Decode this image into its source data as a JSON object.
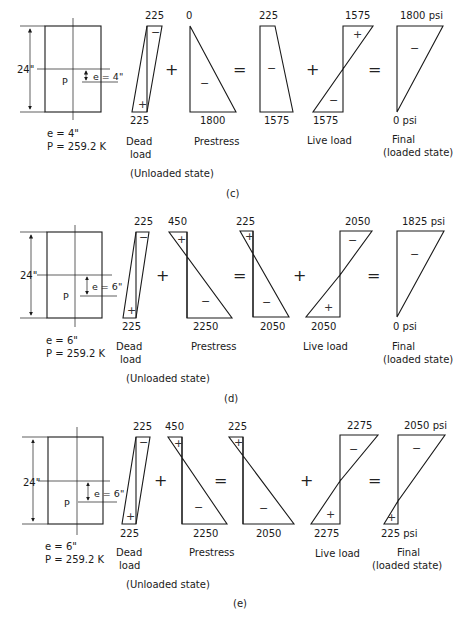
{
  "panels": [
    {
      "id": "c",
      "caption": "(c)",
      "section": {
        "depth": "24\"",
        "e_arrow": "e = 4\"",
        "P_label": "P",
        "e_value": "e = 4\"",
        "P_value": "P = 259.2 K"
      },
      "dead_load": {
        "top": "225",
        "bottom": "225",
        "top_sign": "−",
        "bottom_sign": "+",
        "label1": "Dead",
        "label2": "load"
      },
      "prestress": {
        "top": "0",
        "bottom": "1800",
        "sign": "−",
        "label": "Prestress"
      },
      "sum1": {
        "top": "225",
        "bottom": "1575",
        "sign": "−"
      },
      "live_load": {
        "top": "1575",
        "bottom": "1575",
        "top_sign": "+",
        "bottom_sign": "−",
        "label": "Live load"
      },
      "final": {
        "top": "1800 psi",
        "bottom": "0 psi",
        "sign": "−",
        "label1": "Final",
        "label2": "(loaded state)"
      },
      "unloaded_label": "(Unloaded state)",
      "ops": {
        "plus1": "+",
        "eq1": "=",
        "plus2": "+",
        "eq2": "="
      }
    },
    {
      "id": "d",
      "caption": "(d)",
      "section": {
        "depth": "24\"",
        "e_arrow": "e = 6\"",
        "P_label": "P",
        "e_value": "e = 6\"",
        "P_value": "P = 259.2 K"
      },
      "dead_load": {
        "top": "225",
        "bottom": "225",
        "top_sign": "−",
        "bottom_sign": "+",
        "label1": "Dead",
        "label2": "load"
      },
      "prestress": {
        "top": "450",
        "bottom": "2250",
        "top_sign": "+",
        "sign": "−",
        "label": "Prestress"
      },
      "sum1": {
        "top": "225",
        "bottom": "2050",
        "top_sign": "+",
        "sign": "−"
      },
      "live_load": {
        "top": "2050",
        "bottom": "2050",
        "top_sign": "−",
        "bottom_sign": "+",
        "label": "Live load"
      },
      "final": {
        "top": "1825 psi",
        "bottom": "0 psi",
        "sign": "−",
        "label1": "Final",
        "label2": "(loaded state)"
      },
      "unloaded_label": "(Unloaded state)",
      "ops": {
        "plus1": "+",
        "eq1": "=",
        "plus2": "+",
        "eq2": "="
      }
    },
    {
      "id": "e",
      "caption": "(e)",
      "section": {
        "depth": "24\"",
        "e_arrow": "e = 6\"",
        "P_label": "P",
        "e_value": "e = 6\"",
        "P_value": "P = 259.2 K"
      },
      "dead_load": {
        "top": "225",
        "bottom": "225",
        "top_sign": "−",
        "bottom_sign": "+",
        "label1": "Dead",
        "label2": "load"
      },
      "prestress": {
        "top": "450",
        "bottom": "2250",
        "top_sign": "+",
        "sign": "−",
        "label": "Prestress"
      },
      "sum1": {
        "top": "225",
        "bottom": "2050",
        "top_sign": "+",
        "sign": "−"
      },
      "live_load": {
        "top": "2275",
        "bottom": "2275",
        "top_sign": "−",
        "bottom_sign": "+",
        "label": "Live load"
      },
      "final": {
        "top": "2050 psi",
        "bottom": "225 psi",
        "top_sign": "−",
        "bottom_sign": "+",
        "label1": "Final",
        "label2": "(loaded state)"
      },
      "unloaded_label": "(Unloaded state)",
      "ops": {
        "plus1": "+",
        "eq1": "=",
        "plus2": "+",
        "eq2": "="
      }
    }
  ]
}
